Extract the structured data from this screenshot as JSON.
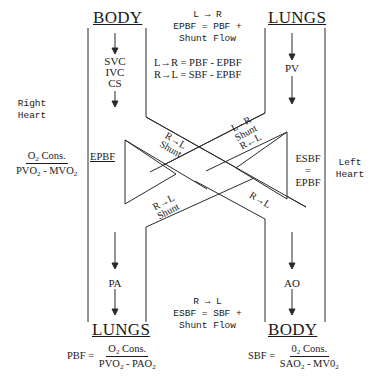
{
  "diagram": {
    "top_left_heading": "BODY",
    "top_right_heading": "LUNGS",
    "bottom_left_heading": "LUNGS",
    "bottom_right_heading": "BODY",
    "venous_inputs": [
      "SVC",
      "IVC",
      "CS"
    ],
    "pv_label": "PV",
    "pa_label": "PA",
    "ao_label": "AO",
    "right_heart_label": [
      "Right",
      "Heart"
    ],
    "left_heart_label": [
      "Left",
      "Heart"
    ],
    "epbf_label": "EPBF",
    "esbf_label": [
      "ESBF",
      "=",
      "EPBF"
    ],
    "left_formula": {
      "numerator": [
        "O",
        "2",
        " Cons."
      ],
      "denominator": [
        "PVO",
        "2",
        " - MVO",
        "2"
      ]
    },
    "top_note": {
      "line1": "L → R",
      "line2": "EPBF = PBF +",
      "line3": "Shunt Flow",
      "eq1": "L→R = PBF - EPBF",
      "eq2": "R→L = SBF - EPBF"
    },
    "bottom_note": {
      "line1": "R → L",
      "line2": "ESBF = SBF +",
      "line3": "Shunt Flow"
    },
    "shunt_labels": {
      "upper_left": [
        "R→L",
        "Shunt"
      ],
      "lower_left": [
        "R→L",
        "Shunt"
      ],
      "upper_right": [
        "L - R",
        "Shunt",
        "R←L"
      ],
      "lower_right": "R→L"
    },
    "pbf_formula": {
      "lhs": "PBF =",
      "numerator": [
        "O",
        "2",
        " Cons."
      ],
      "denominator": [
        "PVO",
        "2",
        " - PAO",
        "2"
      ]
    },
    "sbf_formula": {
      "lhs": "SBF =",
      "numerator": [
        "0",
        "2",
        " Cons."
      ],
      "denominator": [
        "SAO",
        "2",
        " - MV0",
        "2"
      ]
    },
    "line_color": "#1a1a1a"
  }
}
